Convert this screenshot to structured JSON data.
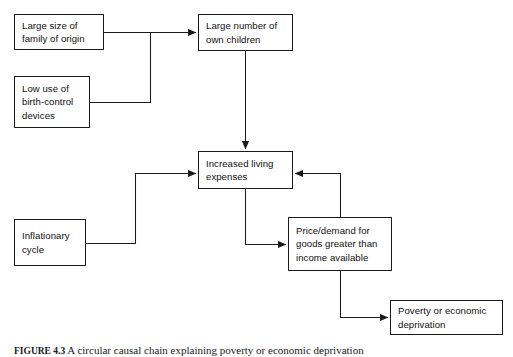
{
  "figure": {
    "caption_number": "FIGURE 4.3",
    "caption_text": "A circular causal chain explaining poverty or economic deprivation"
  },
  "diagram": {
    "type": "flowchart",
    "stroke_color": "#1a1a1a",
    "background_color": "#ffffff",
    "nodes": [
      {
        "id": "large-family",
        "label": "Large size of\nfamily of origin",
        "x": 14,
        "y": 14,
        "width": 90,
        "height": 36
      },
      {
        "id": "low-birth-control",
        "label": "Low use of\nbirth-control\ndevices",
        "x": 14,
        "y": 76,
        "width": 76,
        "height": 52
      },
      {
        "id": "own-children",
        "label": "Large number of\nown children",
        "x": 198,
        "y": 14,
        "width": 95,
        "height": 37
      },
      {
        "id": "living-expenses",
        "label": "Increased living\nexpenses",
        "x": 198,
        "y": 151,
        "width": 95,
        "height": 38
      },
      {
        "id": "inflationary-cycle",
        "label": "Inflationary\ncycle",
        "x": 14,
        "y": 219,
        "width": 72,
        "height": 47
      },
      {
        "id": "price-demand",
        "label": "Price/demand for\ngoods greater than\nincome available",
        "x": 288,
        "y": 217,
        "width": 104,
        "height": 54
      },
      {
        "id": "poverty",
        "label": "Poverty or economic\ndeprivation",
        "x": 390,
        "y": 300,
        "width": 113,
        "height": 35
      }
    ],
    "edges": [
      {
        "id": "edge-large-family-to-own-children",
        "from": "large-family",
        "to": "own-children"
      },
      {
        "id": "edge-low-birth-control-to-own-children",
        "from": "low-birth-control",
        "to": "own-children"
      },
      {
        "id": "edge-own-children-to-living-expenses",
        "from": "own-children",
        "to": "living-expenses"
      },
      {
        "id": "edge-inflationary-cycle-to-living-expenses",
        "from": "inflationary-cycle",
        "to": "living-expenses"
      },
      {
        "id": "edge-living-expenses-to-price-demand",
        "from": "living-expenses",
        "to": "price-demand"
      },
      {
        "id": "edge-price-demand-to-living-expenses",
        "from": "price-demand",
        "to": "living-expenses"
      },
      {
        "id": "edge-price-demand-to-poverty",
        "from": "price-demand",
        "to": "poverty"
      }
    ]
  }
}
